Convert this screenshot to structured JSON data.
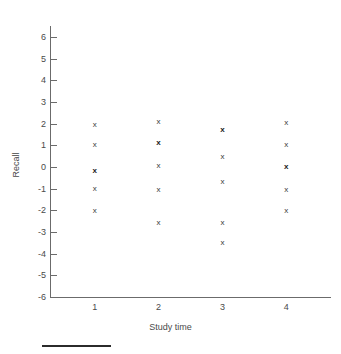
{
  "chart_data": {
    "type": "scatter",
    "title": "",
    "xlabel": "Study time",
    "ylabel": "Recall",
    "xlim": [
      0.3,
      4.7
    ],
    "ylim": [
      -6,
      6
    ],
    "grid": false,
    "legend": "none",
    "marker": "x",
    "x_ticks": [
      1,
      2,
      3,
      4
    ],
    "x_tick_labels": [
      "1",
      "2",
      "3",
      "4"
    ],
    "y_ticks": [
      6,
      5,
      4,
      3,
      2,
      1,
      0,
      -1,
      -2,
      -3,
      -4,
      -5,
      -6
    ],
    "y_tick_labels": [
      "6",
      "5",
      "4",
      "3",
      "2",
      "1",
      "0",
      "-1",
      "-2",
      "-3",
      "-4",
      "-5",
      "-6"
    ],
    "points": [
      {
        "x": 1,
        "y": 1.95,
        "overlap": false
      },
      {
        "x": 1,
        "y": 1.0,
        "overlap": false
      },
      {
        "x": 1,
        "y": -0.2,
        "overlap": true
      },
      {
        "x": 1,
        "y": -1.0,
        "overlap": false
      },
      {
        "x": 1,
        "y": -2.05,
        "overlap": false
      },
      {
        "x": 2,
        "y": 2.1,
        "overlap": false
      },
      {
        "x": 2,
        "y": 1.1,
        "overlap": true
      },
      {
        "x": 2,
        "y": 0.05,
        "overlap": false
      },
      {
        "x": 2,
        "y": -1.05,
        "overlap": false
      },
      {
        "x": 2,
        "y": -2.6,
        "overlap": false
      },
      {
        "x": 3,
        "y": 1.7,
        "overlap": true
      },
      {
        "x": 3,
        "y": 0.45,
        "overlap": false
      },
      {
        "x": 3,
        "y": -0.7,
        "overlap": false
      },
      {
        "x": 3,
        "y": -2.6,
        "overlap": false
      },
      {
        "x": 3,
        "y": -3.5,
        "overlap": false
      },
      {
        "x": 4,
        "y": 2.05,
        "overlap": false
      },
      {
        "x": 4,
        "y": 1.0,
        "overlap": false
      },
      {
        "x": 4,
        "y": 0.0,
        "overlap": true
      },
      {
        "x": 4,
        "y": -1.05,
        "overlap": false
      },
      {
        "x": 4,
        "y": -2.05,
        "overlap": false
      }
    ]
  },
  "colors": {
    "axis": "#6b6b6b",
    "text": "#4a4a4a",
    "marker": "#3a3a3a",
    "rule": "#2b2b2b",
    "background": "#ffffff"
  }
}
